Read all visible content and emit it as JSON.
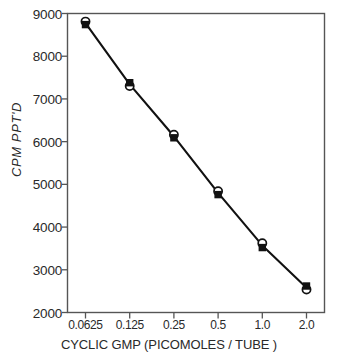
{
  "chart_data": {
    "type": "line",
    "title": "",
    "xlabel": "CYCLIC GMP (PICOMOLES / TUBE )",
    "ylabel": "CPM  PPT'D",
    "categories": [
      "0.0625",
      "0.125",
      "0.25",
      "0.5",
      "1.0",
      "2.0"
    ],
    "xticklabels": [
      "0.0625",
      "0.125",
      "0.25",
      "0.5",
      "1.0",
      "2.0"
    ],
    "yticklabels": [
      "2000",
      "3000",
      "4000",
      "5000",
      "6000",
      "7000",
      "8000",
      "9000"
    ],
    "yticks": [
      2000,
      3000,
      4000,
      5000,
      6000,
      7000,
      8000,
      9000
    ],
    "ylim": [
      2000,
      9000
    ],
    "xlim_note": "categorical / log2 spaced, evenly placed",
    "grid": false,
    "legend": false,
    "series": [
      {
        "name": "filled-square",
        "marker": "filled-square",
        "values": [
          8740,
          7380,
          6090,
          4760,
          3520,
          2620
        ]
      },
      {
        "name": "open-circle",
        "marker": "open-circle",
        "values": [
          8810,
          7300,
          6160,
          4840,
          3620,
          2540
        ]
      }
    ],
    "line_color": "#111111",
    "marker_fill": "#111111",
    "marker_open_fill": "#ffffff",
    "axis_color": "#4a4a4a"
  },
  "axes": {
    "y_axis_title": "CPM  PPT'D",
    "x_axis_title": "CYCLIC GMP (PICOMOLES / TUBE )"
  }
}
